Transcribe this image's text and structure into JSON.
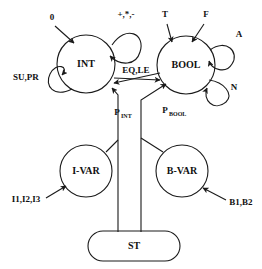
{
  "diagram": {
    "stroke_color": "#1a1a1a",
    "background_color": "#ffffff",
    "nodes": [
      {
        "id": "int",
        "label": "INT",
        "cx": 86,
        "cy": 64,
        "r": 29,
        "shape": "circle"
      },
      {
        "id": "bool",
        "label": "BOOL",
        "cx": 186,
        "cy": 65,
        "r": 29,
        "shape": "circle"
      },
      {
        "id": "ivar",
        "label": "I-VAR",
        "cx": 86,
        "cy": 171,
        "r": 26,
        "shape": "circle"
      },
      {
        "id": "bvar",
        "label": "B-VAR",
        "cx": 182,
        "cy": 171,
        "r": 26,
        "shape": "circle"
      },
      {
        "id": "st",
        "label": "ST",
        "cx": 134,
        "cy": 246,
        "shape": "stadium",
        "w": 92,
        "h": 30
      }
    ],
    "labels": {
      "zero": "0",
      "arith_ops": "+,*,-",
      "su_pr": "SU,PR",
      "eq_le": "EQ,LE",
      "t": "T",
      "f": "F",
      "a": "A",
      "n": "N",
      "p_int_main": "P",
      "p_int_sub": "INT",
      "p_bool_main": "P",
      "p_bool_sub": "BOOL",
      "i_inputs": "I1,I2,I3",
      "b_inputs": "B1,B2"
    }
  }
}
